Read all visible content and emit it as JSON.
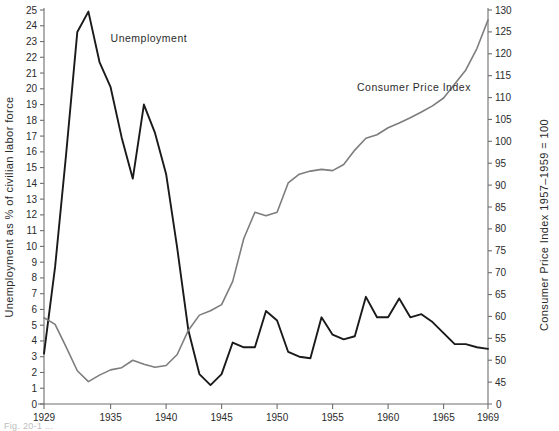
{
  "figure": {
    "caption_fragment": "Fig. 20-1  ..."
  },
  "chart_data": {
    "type": "line",
    "title": "",
    "xlabel": "",
    "grid": false,
    "legend_position": "inline-annotations",
    "x": [
      1929,
      1930,
      1931,
      1932,
      1933,
      1934,
      1935,
      1936,
      1937,
      1938,
      1939,
      1940,
      1941,
      1942,
      1943,
      1944,
      1945,
      1946,
      1947,
      1948,
      1949,
      1950,
      1951,
      1952,
      1953,
      1954,
      1955,
      1956,
      1957,
      1958,
      1959,
      1960,
      1961,
      1962,
      1963,
      1964,
      1965,
      1966,
      1967,
      1968,
      1969
    ],
    "xticks": [
      1929,
      1935,
      1940,
      1945,
      1950,
      1955,
      1960,
      1965,
      1969
    ],
    "xlim": [
      1929,
      1969
    ],
    "axes": [
      {
        "id": "left",
        "label": "Unemployment as % of civilian labor force",
        "ylim": [
          0,
          25
        ],
        "yticks": [
          0,
          1,
          2,
          3,
          4,
          5,
          6,
          7,
          8,
          9,
          10,
          11,
          12,
          13,
          14,
          15,
          16,
          17,
          18,
          19,
          20,
          21,
          22,
          23,
          24,
          25
        ]
      },
      {
        "id": "right",
        "label": "Consumer Price Index  1957–1959 = 100",
        "ylim": [
          40,
          130
        ],
        "yticks": [
          0,
          45,
          50,
          55,
          60,
          65,
          70,
          75,
          80,
          85,
          90,
          95,
          100,
          105,
          110,
          115,
          120,
          125,
          130
        ],
        "zero_tick_label": "0"
      }
    ],
    "series": [
      {
        "name": "Unemployment",
        "axis": "left",
        "color": "#1a1a1a",
        "width": 1.9,
        "label_text": "Unemployment",
        "values": [
          3.2,
          8.7,
          15.9,
          23.6,
          24.9,
          21.7,
          20.1,
          16.9,
          14.3,
          19.0,
          17.2,
          14.6,
          9.9,
          4.7,
          1.9,
          1.2,
          1.9,
          3.9,
          3.6,
          3.6,
          5.9,
          5.3,
          3.3,
          3.0,
          2.9,
          5.5,
          4.4,
          4.1,
          4.3,
          6.8,
          5.5,
          5.5,
          6.7,
          5.5,
          5.7,
          5.2,
          4.5,
          3.8,
          3.8,
          3.6,
          3.5
        ]
      },
      {
        "name": "Consumer Price Index",
        "axis": "right",
        "color": "#7d7d7d",
        "width": 1.6,
        "label_text": "Consumer Price Index",
        "values": [
          59.7,
          58.2,
          53.0,
          47.6,
          45.1,
          46.6,
          47.8,
          48.3,
          50.0,
          49.1,
          48.4,
          48.8,
          51.3,
          56.8,
          60.3,
          61.3,
          62.7,
          68.0,
          77.8,
          83.8,
          83.0,
          83.8,
          90.5,
          92.5,
          93.2,
          93.6,
          93.3,
          94.7,
          98.0,
          100.7,
          101.5,
          103.1,
          104.2,
          105.4,
          106.7,
          108.1,
          109.9,
          113.1,
          116.3,
          121.2,
          127.7
        ]
      }
    ],
    "annotations": [
      {
        "text": "Unemployment",
        "x": 1935.0,
        "y_axis": "left",
        "y": 23.0
      },
      {
        "text": "Consumer Price Index",
        "x": 1957.2,
        "y_axis": "right",
        "y": 111.5
      }
    ]
  }
}
